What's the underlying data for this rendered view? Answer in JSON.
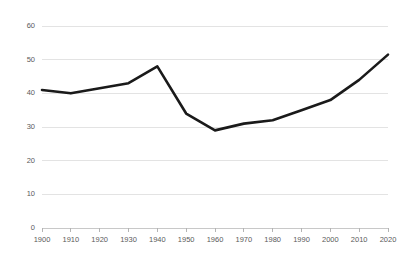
{
  "chart_data": {
    "type": "line",
    "title": "",
    "subtitle": "",
    "xlabel": "",
    "ylabel": "",
    "x": [
      1900,
      1910,
      1920,
      1930,
      1940,
      1950,
      1960,
      1970,
      1980,
      1990,
      2000,
      2010,
      2020
    ],
    "categories": [
      "1900",
      "1910",
      "1920",
      "1930",
      "1940",
      "1950",
      "1960",
      "1970",
      "1980",
      "1990",
      "2000",
      "2010",
      "2020"
    ],
    "values": [
      41,
      40,
      41.5,
      43,
      48,
      34,
      29,
      31,
      32,
      35,
      38,
      44,
      51.5
    ],
    "series": [
      {
        "name": "",
        "values": [
          41,
          40,
          41.5,
          43,
          48,
          34,
          29,
          31,
          32,
          35,
          38,
          44,
          51.5
        ]
      }
    ],
    "xlim": [
      1900,
      2020
    ],
    "ylim": [
      0,
      60
    ],
    "ytick_values": [
      0,
      10,
      20,
      30,
      40,
      50,
      60
    ],
    "ytick_labels": [
      "0",
      "10",
      "20",
      "30",
      "40",
      "50",
      "60"
    ],
    "xtick_labels": [
      "1900",
      "1910",
      "1920",
      "1930",
      "1940",
      "1950",
      "1960",
      "1970",
      "1980",
      "1990",
      "2000",
      "2010",
      "2020"
    ],
    "grid": true,
    "grid_axis": "y",
    "legend": false,
    "legend_position": "none",
    "annotations": [],
    "colors": {
      "line": "#1a1a1a",
      "gridline": "#e3e3e3",
      "axis": "#c8c8c8",
      "tick_label": "#5a5a5a",
      "background": "#ffffff"
    }
  }
}
